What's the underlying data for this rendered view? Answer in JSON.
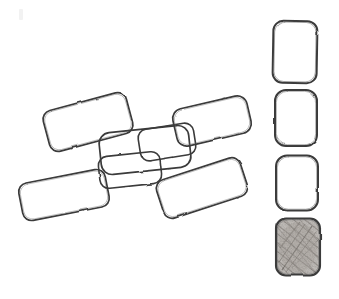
{
  "document": {
    "title": "Hand-drawn rectangle sketch",
    "background_color": "#ffffff",
    "width": 339,
    "height": 299,
    "medium": "pencil sketch on white paper",
    "description": "Seven outlined rounded rectangles scattered at angles on the left, and a vertical column of four rounded rectangles on the right, the bottom-most of which is shaded with diagonal pencil hatching."
  },
  "style": {
    "ink_color": "#3a3a3a",
    "ink_color_light": "#6d6d6d",
    "shade_fill_color": "#b8b4b0",
    "hatch_color": "#8a8580",
    "stroke_width": 1.7
  },
  "shapes": {
    "scatter_group_label": "scattered rectangles",
    "column_group_label": "stacked rectangles column",
    "scattered": [
      {
        "name": "rect-upper-left",
        "rotation": -15,
        "shaded": false,
        "cx": 88,
        "cy": 122,
        "w": 86,
        "h": 42,
        "r": 9
      },
      {
        "name": "rect-lower-left",
        "rotation": -11,
        "shaded": false,
        "cx": 64,
        "cy": 195,
        "w": 88,
        "h": 38,
        "r": 9
      },
      {
        "name": "rect-center-large",
        "rotation": -6,
        "shaded": false,
        "cx": 145,
        "cy": 150,
        "w": 90,
        "h": 42,
        "r": 11
      },
      {
        "name": "rect-center-small-right",
        "rotation": -9,
        "shaded": false,
        "cx": 167,
        "cy": 142,
        "w": 56,
        "h": 32,
        "r": 9
      },
      {
        "name": "rect-center-lower",
        "rotation": -6,
        "shaded": false,
        "cx": 130,
        "cy": 170,
        "w": 62,
        "h": 32,
        "r": 9
      },
      {
        "name": "rect-upper-right",
        "rotation": -13,
        "shaded": false,
        "cx": 212,
        "cy": 121,
        "w": 76,
        "h": 38,
        "r": 10
      },
      {
        "name": "rect-lower-right",
        "rotation": -18,
        "shaded": false,
        "cx": 202,
        "cy": 188,
        "w": 88,
        "h": 40,
        "r": 9
      }
    ],
    "column": [
      {
        "name": "column-rect-1",
        "rotation": 1,
        "shaded": false,
        "cx": 295,
        "cy": 52,
        "w": 44,
        "h": 62,
        "r": 10
      },
      {
        "name": "column-rect-2",
        "rotation": 0,
        "shaded": false,
        "cx": 296,
        "cy": 118,
        "w": 42,
        "h": 56,
        "r": 11
      },
      {
        "name": "column-rect-3",
        "rotation": 0,
        "shaded": false,
        "cx": 297,
        "cy": 183,
        "w": 42,
        "h": 55,
        "r": 11
      },
      {
        "name": "column-rect-4-shaded",
        "rotation": 0,
        "shaded": true,
        "cx": 298,
        "cy": 247,
        "w": 44,
        "h": 57,
        "r": 10
      }
    ]
  }
}
